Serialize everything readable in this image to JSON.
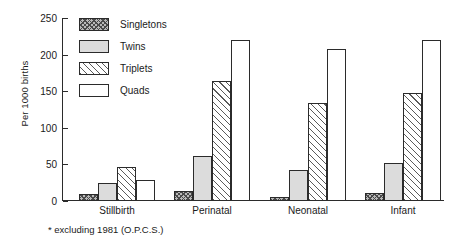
{
  "chart_data": {
    "type": "bar",
    "title": "",
    "xlabel": "",
    "ylabel": "Per 1000 births",
    "ylim": [
      0,
      250
    ],
    "yticks": [
      0,
      50,
      100,
      150,
      200,
      250
    ],
    "grid": false,
    "legend_position": "top-left-inside",
    "categories": [
      "Stillbirth",
      "Perinatal",
      "Neonatal",
      "Infant"
    ],
    "series": [
      {
        "name": "Singletons",
        "pattern": "cross-hatch",
        "values": [
          9,
          13,
          6,
          11
        ]
      },
      {
        "name": "Twins",
        "pattern": "solid-light-gray",
        "values": [
          25,
          62,
          42,
          52
        ]
      },
      {
        "name": "Triplets",
        "pattern": "diagonal-hatch",
        "values": [
          47,
          164,
          134,
          147
        ]
      },
      {
        "name": "Quads",
        "pattern": "white",
        "values": [
          29,
          220,
          208,
          220
        ]
      }
    ],
    "annotations": [
      "* excluding 1981 (O.P.C.S.)"
    ]
  },
  "axis": {
    "y_label": "Per 1000 births",
    "y_ticks": [
      "0",
      "50",
      "100",
      "150",
      "200",
      "250"
    ],
    "x_ticks": [
      "Stillbirth",
      "Perinatal",
      "Neonatal",
      "Infant"
    ]
  },
  "legend": {
    "items": [
      {
        "label": "Singletons"
      },
      {
        "label": "Twins"
      },
      {
        "label": "Triplets"
      },
      {
        "label": "Quads"
      }
    ]
  },
  "footnote": {
    "text": "* excluding 1981 (O.P.C.S.)"
  }
}
